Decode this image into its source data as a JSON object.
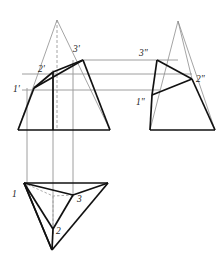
{
  "figure": {
    "type": "descriptive-geometry-orthographic-projection",
    "canvas": {
      "width": 223,
      "height": 258,
      "background": "#ffffff"
    },
    "styles": {
      "object_line_color": "#111111",
      "object_line_width": 1.7,
      "projection_line_color": "#9a9a9a",
      "projection_line_width": 1.0,
      "construction_line_color": "#8d8d8d",
      "construction_line_width": 0.8,
      "hidden_line_color": "#9a9a9a",
      "label_color": "#1a1a1a"
    },
    "views": [
      {
        "name": "front-view",
        "id": "front",
        "cone_apex": {
          "x": 57,
          "y": 20
        },
        "cone_base_left": {
          "x": 18,
          "y": 130
        },
        "cone_base_right": {
          "x": 110,
          "y": 130
        },
        "axis_line": {
          "x1": 57,
          "y1": 20,
          "x2": 57,
          "y2": 130
        },
        "points": [
          {
            "label": "1'",
            "x": 34,
            "y": 88,
            "label_x": 13,
            "label_y": 92
          },
          {
            "label": "2'",
            "x": 53,
            "y": 72,
            "label_x": 38,
            "label_y": 72
          },
          {
            "label": "3'",
            "x": 83,
            "y": 60,
            "label_x": 74,
            "label_y": 51
          }
        ],
        "section_edges": [
          [
            "1'",
            "2'"
          ],
          [
            "2'",
            "3'"
          ],
          [
            "1'",
            "3'"
          ]
        ]
      },
      {
        "name": "side-view",
        "id": "side",
        "cone_apex": {
          "x": 178,
          "y": 21
        },
        "cone_base_left": {
          "x": 150,
          "y": 130
        },
        "cone_base_right": {
          "x": 215,
          "y": 130
        },
        "points": [
          {
            "label": "3\"",
            "x": 157,
            "y": 60,
            "label_x": 140,
            "label_y": 53
          },
          {
            "label": "2\"",
            "x": 192,
            "y": 79,
            "label_x": 196,
            "label_y": 80
          },
          {
            "label": "1\"",
            "x": 152,
            "y": 95,
            "label_x": 136,
            "label_y": 104
          }
        ],
        "section_edges": [
          [
            "3\"",
            "2\""
          ],
          [
            "2\"",
            "1\""
          ],
          [
            "3\"",
            "1\""
          ]
        ]
      },
      {
        "name": "top-view",
        "id": "top",
        "points": [
          {
            "label": "1",
            "x": 24,
            "y": 183,
            "label_x": 13,
            "label_y": 196
          },
          {
            "label": "2",
            "x": 53,
            "y": 229,
            "label_x": 57,
            "label_y": 231
          },
          {
            "label": "3",
            "x": 73,
            "y": 195,
            "label_x": 78,
            "label_y": 201
          }
        ],
        "outer_triangle": [
          {
            "x": 24,
            "y": 183
          },
          {
            "x": 108,
            "y": 183
          },
          {
            "x": 52,
            "y": 250
          }
        ],
        "center": {
          "x": 53,
          "y": 196
        }
      }
    ],
    "projection_lines": {
      "vertical": [
        {
          "from_view": "front",
          "point": "1'",
          "x": 27,
          "y1": 88,
          "y2": 190
        },
        {
          "from_view": "front",
          "point": "2'",
          "x": 53,
          "y1": 72,
          "y2": 232
        },
        {
          "from_view": "front",
          "point": "3'",
          "x": 73,
          "y1": 60,
          "y2": 196
        }
      ],
      "horizontal": [
        {
          "point_pair": [
            "3'",
            "3\""
          ],
          "y": 60,
          "x1": 83,
          "x2": 178
        },
        {
          "point_pair": [
            "2'",
            "2\""
          ],
          "y": 74,
          "x1": 22,
          "x2": 192
        },
        {
          "point_pair": [
            "1'",
            "1\""
          ],
          "y": 90,
          "x1": 22,
          "x2": 160
        }
      ]
    },
    "labels": {
      "front": [
        "1'",
        "2'",
        "3'"
      ],
      "side": [
        "1\"",
        "2\"",
        "3\""
      ],
      "top": [
        "1",
        "2",
        "3"
      ]
    }
  }
}
